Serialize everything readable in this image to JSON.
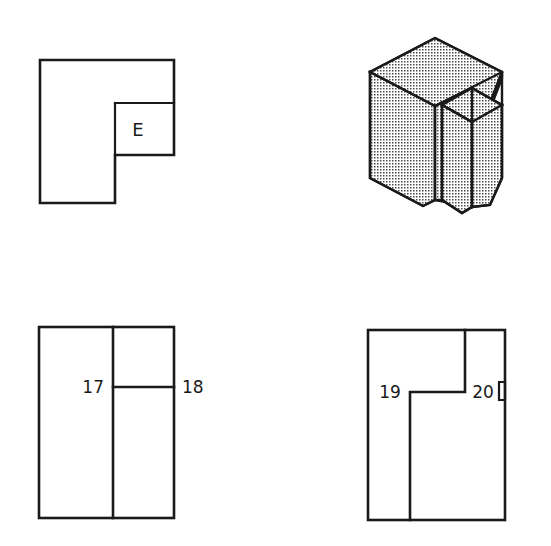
{
  "sheet": {
    "background_color": "#ffffff",
    "line_color": "#1a1a1a",
    "shading_color": "#9a9a9a",
    "width": 551,
    "height": 546
  },
  "figures": {
    "top_left": {
      "name": "L-shaped orthographic view with lettered surface",
      "surface_label": "E",
      "outline_points": "40,60 174,60 174,155 115,155 115,203 40,203",
      "inner_notch_line": "115,103 174,103",
      "inner_notch_vertical": "115,103 115,155"
    },
    "top_right": {
      "name": "Isometric pictorial of notched block",
      "shading": "stipple-dots",
      "apex": "435,38"
    },
    "bottom_left": {
      "name": "Orthographic view with surfaces 17 and 18",
      "labels": [
        {
          "text": "17",
          "x": 96,
          "y": 392,
          "anchor": "end",
          "position": "inside-left-of-divider"
        },
        {
          "text": "18",
          "x": 183,
          "y": 392,
          "anchor": "start",
          "position": "outside-right-edge"
        }
      ],
      "outline": "39,327 174,327 174,518 39,518",
      "vertical_divider": "113,327 113,518",
      "horizontal_line": "113,387 174,387"
    },
    "bottom_right": {
      "name": "Orthographic view with surfaces 19 and 20",
      "labels": [
        {
          "text": "19",
          "x": 390,
          "y": 392,
          "anchor": "middle",
          "position": "inside-left"
        },
        {
          "text": "20",
          "x": 483,
          "y": 392,
          "anchor": "middle",
          "position": "inside-right"
        }
      ],
      "outline": "368,330 505,330 505,520 368,520",
      "step_path": "465,330 465,392 410,392 410,520",
      "notch_marker": "499,380 505,380 505,398 499,398"
    }
  },
  "labels": {
    "e": "E",
    "seventeen": "17",
    "eighteen": "18",
    "nineteen": "19",
    "twenty": "20"
  }
}
